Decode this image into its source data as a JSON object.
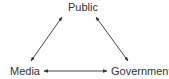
{
  "diagram": {
    "type": "triangle-relationship",
    "nodes": {
      "public": "Public",
      "media": "Media",
      "government": "Government"
    },
    "edges": [
      {
        "from": "Media",
        "to": "Public",
        "bidirectional": true
      },
      {
        "from": "Public",
        "to": "Government",
        "bidirectional": true
      },
      {
        "from": "Media",
        "to": "Government",
        "bidirectional": true
      }
    ],
    "colors": {
      "line": "#333333",
      "text": "#333333",
      "background": "#ffffff"
    }
  }
}
